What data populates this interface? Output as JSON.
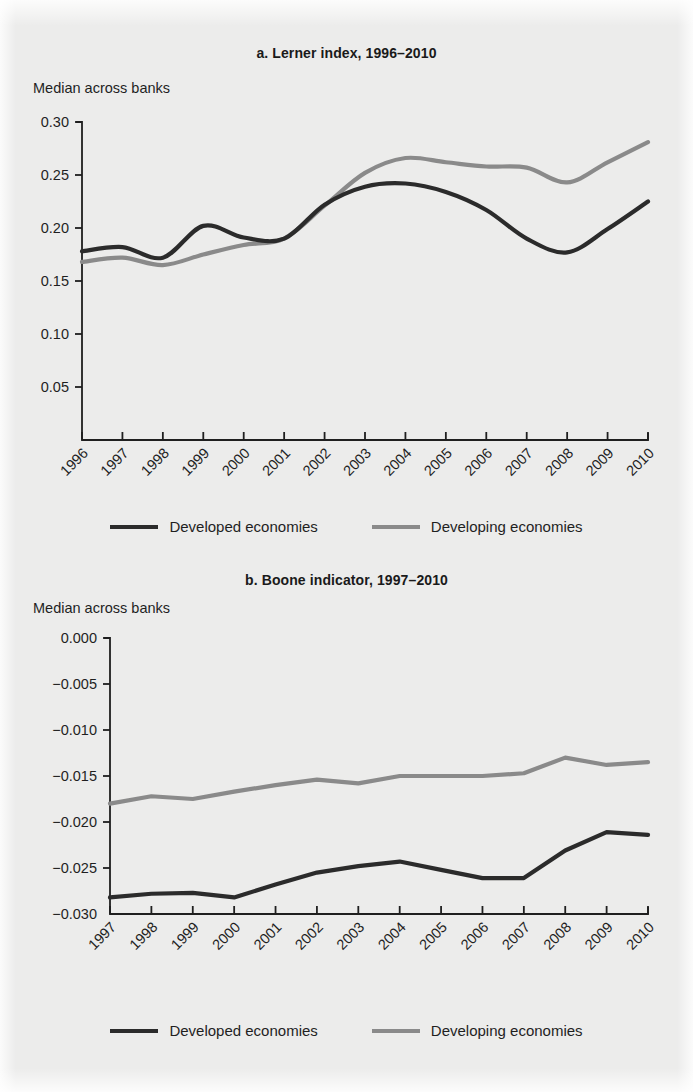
{
  "figure": {
    "background_color": "#ececeb",
    "series_colors": {
      "developed": "#2b2b2b",
      "developing": "#8a8a8a"
    },
    "axis_color": "#1f1f1f"
  },
  "legend": {
    "developed_label": "Developed economies",
    "developing_label": "Developing economies"
  },
  "panel_a": {
    "title": "a.  Lerner index, 1996–2010",
    "axis_note": "Median across banks"
  },
  "panel_b": {
    "title": "b.  Boone indicator, 1997–2010",
    "axis_note": "Median across banks"
  },
  "chart_data": [
    {
      "type": "line",
      "title": "a.  Lerner index, 1996–2010",
      "xlabel": "",
      "ylabel": "Median across banks",
      "ylim": [
        0.0,
        0.3
      ],
      "yticks": [
        0.05,
        0.1,
        0.15,
        0.2,
        0.25,
        0.3
      ],
      "ytick_labels": [
        "0.05",
        "0.10",
        "0.15",
        "0.20",
        "0.25",
        "0.30"
      ],
      "grid": false,
      "legend_position": "below",
      "smoothed": true,
      "categories": [
        1996,
        1997,
        1998,
        1999,
        2000,
        2001,
        2002,
        2003,
        2004,
        2005,
        2006,
        2007,
        2008,
        2009,
        2010
      ],
      "xtick_labels": [
        "1996",
        "1997",
        "1998",
        "1999",
        "2000",
        "2001",
        "2002",
        "2003",
        "2004",
        "2005",
        "2006",
        "2007",
        "2008",
        "2009",
        "2010"
      ],
      "series": [
        {
          "name": "Developed economies",
          "color": "#2b2b2b",
          "values": [
            0.178,
            0.182,
            0.172,
            0.202,
            0.191,
            0.19,
            0.222,
            0.239,
            0.242,
            0.234,
            0.217,
            0.19,
            0.177,
            0.199,
            0.225
          ]
        },
        {
          "name": "Developing economies",
          "color": "#8a8a8a",
          "values": [
            0.168,
            0.172,
            0.165,
            0.175,
            0.184,
            0.19,
            0.221,
            0.252,
            0.266,
            0.262,
            0.258,
            0.257,
            0.243,
            0.262,
            0.281
          ]
        }
      ]
    },
    {
      "type": "line",
      "title": "b.  Boone indicator, 1997–2010",
      "xlabel": "",
      "ylabel": "Median across banks",
      "ylim": [
        -0.03,
        0.0
      ],
      "yticks": [
        -0.03,
        -0.025,
        -0.02,
        -0.015,
        -0.01,
        -0.005,
        0.0
      ],
      "ytick_labels": [
        "−0.030",
        "−0.025",
        "−0.020",
        "−0.015",
        "−0.010",
        "−0.005",
        "0.000"
      ],
      "grid": false,
      "legend_position": "below",
      "smoothed": false,
      "categories": [
        1997,
        1998,
        1999,
        2000,
        2001,
        2002,
        2003,
        2004,
        2005,
        2006,
        2007,
        2008,
        2009,
        2010
      ],
      "xtick_labels": [
        "1997",
        "1998",
        "1999",
        "2000",
        "2001",
        "2002",
        "2003",
        "2004",
        "2005",
        "2006",
        "2007",
        "2008",
        "2009",
        "2010"
      ],
      "series": [
        {
          "name": "Developed economies",
          "color": "#2b2b2b",
          "values": [
            -0.0282,
            -0.0278,
            -0.0277,
            -0.0282,
            -0.0268,
            -0.0255,
            -0.0248,
            -0.0243,
            -0.0252,
            -0.0261,
            -0.0261,
            -0.0231,
            -0.0211,
            -0.0214
          ]
        },
        {
          "name": "Developing economies",
          "color": "#8a8a8a",
          "values": [
            -0.018,
            -0.0172,
            -0.0175,
            -0.0167,
            -0.016,
            -0.0154,
            -0.0158,
            -0.015,
            -0.015,
            -0.015,
            -0.0147,
            -0.013,
            -0.0138,
            -0.0135
          ]
        }
      ]
    }
  ]
}
